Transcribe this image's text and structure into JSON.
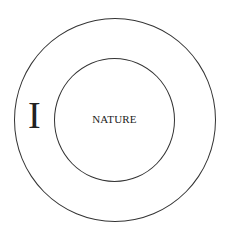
{
  "diagram": {
    "outer_circle": {
      "label": "I"
    },
    "inner_circle": {
      "label": "NATURE"
    },
    "stroke_color": "#333333"
  }
}
